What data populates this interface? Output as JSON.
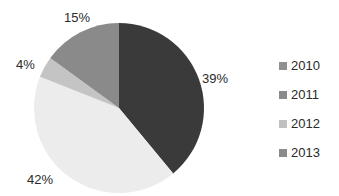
{
  "chart_data": {
    "type": "pie",
    "title": "",
    "categories": [
      "2010",
      "2011",
      "2012",
      "2013"
    ],
    "values": [
      39,
      42,
      4,
      15
    ],
    "labels": [
      "39%",
      "42%",
      "4%",
      "15%"
    ],
    "colors": [
      "#3a3a3a",
      "#ececec",
      "#c4c4c4",
      "#8a8a8a"
    ],
    "start_angle": "12 o'clock",
    "direction": "clockwise",
    "legend_position": "right"
  },
  "legend": {
    "items": [
      {
        "label": "2010",
        "color": "#8f8f8f"
      },
      {
        "label": "2011",
        "color": "#8a8a8a"
      },
      {
        "label": "2012",
        "color": "#c0c0c0"
      },
      {
        "label": "2013",
        "color": "#8a8a8a"
      }
    ]
  }
}
